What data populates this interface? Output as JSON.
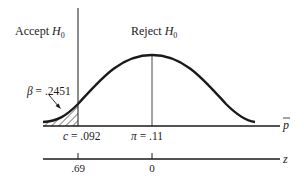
{
  "diagram": {
    "type": "hypothesis-test-normal-curve",
    "regions": {
      "accept": {
        "text": "Accept ",
        "var": "H",
        "sub": "0"
      },
      "reject": {
        "text": "Reject ",
        "var": "H",
        "sub": "0"
      }
    },
    "beta_label": {
      "sym": "β",
      "value": " = .2451"
    },
    "critical_value": {
      "sym": "c",
      "value": " = .092"
    },
    "true_mean": {
      "sym": "π",
      "value": " = .11"
    },
    "axes": {
      "p_axis": {
        "label": "p",
        "overbar": true
      },
      "z_axis": {
        "label": "z",
        "ticks": [
          ".69",
          "0"
        ]
      }
    },
    "colors": {
      "ink": "#1a1a1a",
      "background": "#ffffff"
    }
  }
}
